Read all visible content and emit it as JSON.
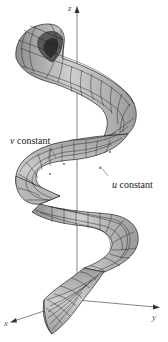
{
  "figure": {
    "axes": {
      "z_label": "z",
      "x_label": "x",
      "y_label": "y"
    },
    "annotations": [
      {
        "var": "v",
        "text": " constant"
      },
      {
        "var": "u",
        "text": " constant"
      }
    ],
    "colors": {
      "surface_fill": "#a9a9a9",
      "surface_light": "#cfcfcf",
      "grid_lines": "#1e1e1e",
      "axis": "#555555",
      "background": "#ffffff"
    }
  }
}
